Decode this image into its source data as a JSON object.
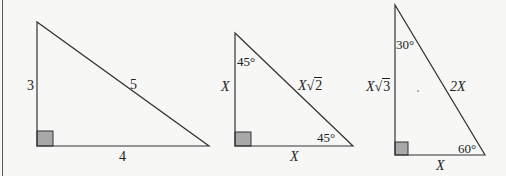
{
  "diagram": {
    "title": "",
    "colors": {
      "stroke": "#333333",
      "right_angle_fill": "#a8a8a8",
      "background": "#f7f7f6"
    },
    "triangles": [
      {
        "name": "3-4-5 triangle",
        "sides": {
          "vertical": "3",
          "hypotenuse": "5",
          "base": "4"
        },
        "angles": {}
      },
      {
        "name": "45-45-90 triangle",
        "sides": {
          "vertical": "X",
          "hypotenuse_var": "X",
          "hypotenuse_root": "2",
          "base": "X"
        },
        "angles": {
          "top": "45°",
          "bottom_right": "45°"
        }
      },
      {
        "name": "30-60-90 triangle",
        "sides": {
          "vertical_var": "X",
          "vertical_root": "3",
          "hypotenuse": "2X",
          "base": "X"
        },
        "angles": {
          "top": "30°",
          "bottom_right": "60°"
        }
      }
    ]
  }
}
